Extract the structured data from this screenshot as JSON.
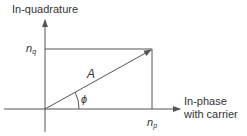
{
  "diagram": {
    "y_axis_label": "In-quadrature",
    "x_axis_label_line1": "In-phase",
    "x_axis_label_line2": "with carrier",
    "nq_label": "n",
    "nq_sub": "q",
    "np_label": "n",
    "np_sub": "p",
    "vector_label": "A",
    "angle_label": "ϕ",
    "colors": {
      "stroke": "#555555",
      "text": "#333333"
    }
  }
}
